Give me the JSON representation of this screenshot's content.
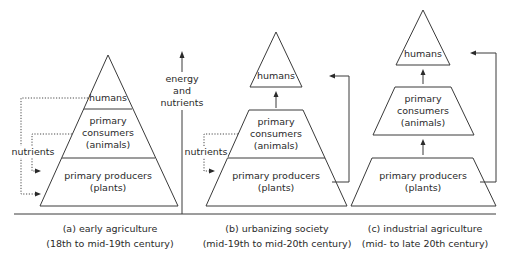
{
  "diagram": {
    "axis": {
      "label_line1": "energy",
      "label_line2": "and",
      "label_line3": "nutrients"
    },
    "panels": [
      {
        "id": "a",
        "caption_line1": "(a) early agriculture",
        "caption_line2": "(18th to mid-19th century)",
        "levels": {
          "humans": "humans",
          "consumers_line1": "primary",
          "consumers_line2": "consumers",
          "consumers_line3": "(animals)",
          "producers_line1": "primary producers",
          "producers_line2": "(plants)"
        },
        "nutrients_label": "nutrients"
      },
      {
        "id": "b",
        "caption_line1": "(b) urbanizing society",
        "caption_line2": "(mid-19th to mid-20th century)",
        "levels": {
          "humans": "humans",
          "consumers_line1": "primary",
          "consumers_line2": "consumers",
          "consumers_line3": "(animals)",
          "producers_line1": "primary producers",
          "producers_line2": "(plants)"
        },
        "nutrients_label": "nutrients"
      },
      {
        "id": "c",
        "caption_line1": "(c) industrial agriculture",
        "caption_line2": "(mid- to late 20th century)",
        "levels": {
          "humans": "humans",
          "consumers_line1": "primary",
          "consumers_line2": "consumers",
          "consumers_line3": "(animals)",
          "producers_line1": "primary producers",
          "producers_line2": "(plants)"
        }
      }
    ]
  }
}
